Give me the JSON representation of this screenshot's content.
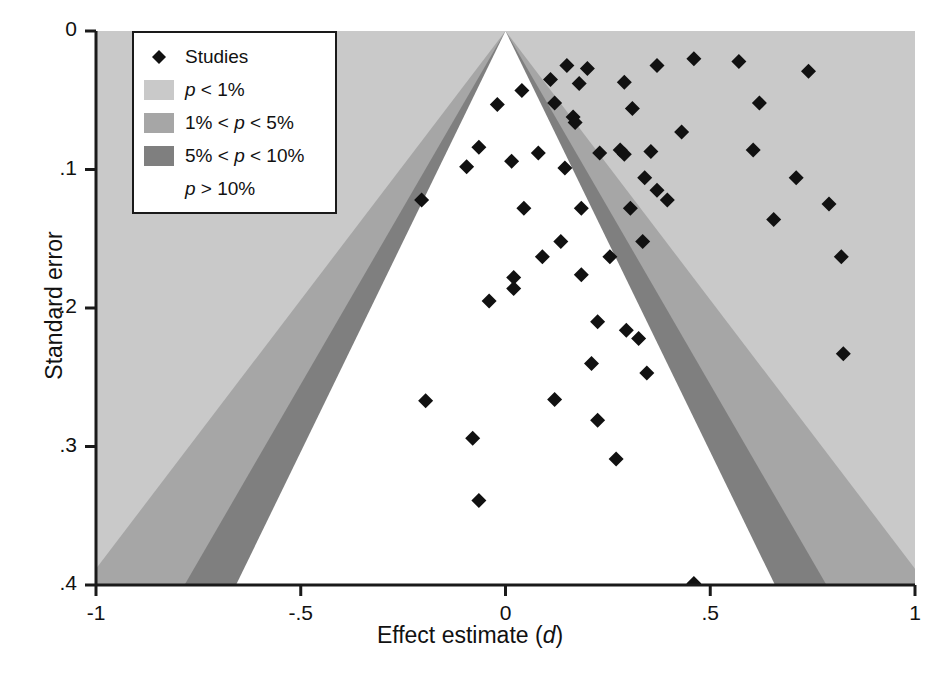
{
  "chart_data": {
    "type": "scatter",
    "subtype": "contour-enhanced funnel plot",
    "title": "",
    "xlabel": "Effect estimate (d)",
    "ylabel": "Standard error",
    "xlim": [
      -1,
      1
    ],
    "ylim": [
      0,
      0.4
    ],
    "y_inverted": true,
    "grid": false,
    "xticks": [
      -1,
      -0.5,
      0,
      0.5,
      1
    ],
    "xticklabels": [
      "-1",
      "-.5",
      "0",
      ".5",
      "1"
    ],
    "yticks": [
      0,
      0.1,
      0.2,
      0.3,
      0.4
    ],
    "yticklabels": [
      "0",
      ".1",
      ".2",
      ".3",
      ".4"
    ],
    "funnel": {
      "apex_x": 0,
      "contours": [
        {
          "name": "p > 10%",
          "z": 1.645,
          "color": "#ffffff"
        },
        {
          "name": "5% < p < 10%",
          "z_from": 1.645,
          "z_to": 1.96,
          "color": "#7f7f7f"
        },
        {
          "name": "1% < p < 5%",
          "z_from": 1.96,
          "z_to": 2.576,
          "color": "#a6a6a6"
        },
        {
          "name": "p < 1%",
          "z_from": 2.576,
          "color": "#c9c9c9"
        }
      ]
    },
    "series": [
      {
        "name": "Studies",
        "marker": "diamond",
        "color": "#111111",
        "points": [
          {
            "d": 0.46,
            "se": 0.02
          },
          {
            "d": 0.15,
            "se": 0.025
          },
          {
            "d": 0.2,
            "se": 0.027
          },
          {
            "d": 0.37,
            "se": 0.025
          },
          {
            "d": 0.57,
            "se": 0.022
          },
          {
            "d": 0.11,
            "se": 0.035
          },
          {
            "d": 0.18,
            "se": 0.038
          },
          {
            "d": 0.29,
            "se": 0.037
          },
          {
            "d": 0.74,
            "se": 0.029
          },
          {
            "d": 0.04,
            "se": 0.043
          },
          {
            "d": -0.02,
            "se": 0.053
          },
          {
            "d": 0.12,
            "se": 0.052
          },
          {
            "d": 0.62,
            "se": 0.052
          },
          {
            "d": 0.31,
            "se": 0.056
          },
          {
            "d": 0.165,
            "se": 0.062
          },
          {
            "d": 0.17,
            "se": 0.066
          },
          {
            "d": 0.43,
            "se": 0.073
          },
          {
            "d": -0.065,
            "se": 0.084
          },
          {
            "d": 0.08,
            "se": 0.088
          },
          {
            "d": 0.23,
            "se": 0.088
          },
          {
            "d": 0.28,
            "se": 0.086
          },
          {
            "d": 0.29,
            "se": 0.089
          },
          {
            "d": 0.355,
            "se": 0.087
          },
          {
            "d": 0.605,
            "se": 0.086
          },
          {
            "d": -0.095,
            "se": 0.098
          },
          {
            "d": 0.015,
            "se": 0.094
          },
          {
            "d": 0.145,
            "se": 0.099
          },
          {
            "d": 0.34,
            "se": 0.106
          },
          {
            "d": 0.71,
            "se": 0.106
          },
          {
            "d": 0.37,
            "se": 0.115
          },
          {
            "d": -0.205,
            "se": 0.122
          },
          {
            "d": 0.395,
            "se": 0.122
          },
          {
            "d": 0.045,
            "se": 0.128
          },
          {
            "d": 0.185,
            "se": 0.128
          },
          {
            "d": 0.305,
            "se": 0.128
          },
          {
            "d": 0.79,
            "se": 0.125
          },
          {
            "d": 0.655,
            "se": 0.136
          },
          {
            "d": 0.135,
            "se": 0.152
          },
          {
            "d": 0.335,
            "se": 0.152
          },
          {
            "d": 0.09,
            "se": 0.163
          },
          {
            "d": 0.255,
            "se": 0.163
          },
          {
            "d": 0.82,
            "se": 0.163
          },
          {
            "d": 0.02,
            "se": 0.178
          },
          {
            "d": 0.02,
            "se": 0.186
          },
          {
            "d": 0.185,
            "se": 0.176
          },
          {
            "d": -0.04,
            "se": 0.195
          },
          {
            "d": 0.225,
            "se": 0.21
          },
          {
            "d": 0.295,
            "se": 0.216
          },
          {
            "d": 0.325,
            "se": 0.222
          },
          {
            "d": 0.825,
            "se": 0.233
          },
          {
            "d": -0.195,
            "se": 0.267
          },
          {
            "d": 0.21,
            "se": 0.24
          },
          {
            "d": 0.345,
            "se": 0.247
          },
          {
            "d": 0.12,
            "se": 0.266
          },
          {
            "d": 0.225,
            "se": 0.281
          },
          {
            "d": -0.08,
            "se": 0.294
          },
          {
            "d": 0.27,
            "se": 0.309
          },
          {
            "d": -0.065,
            "se": 0.339
          },
          {
            "d": 0.46,
            "se": 0.399
          }
        ]
      }
    ]
  },
  "axes": {
    "x_title_pre": "Effect estimate (",
    "x_title_italic": "d",
    "x_title_post": ")",
    "y_title": "Standard error"
  },
  "legend": {
    "items": [
      {
        "label": "Studies",
        "swatch": "marker",
        "color": "#111111"
      },
      {
        "label_pre": "p",
        "label_post": " < 1%",
        "swatch": "fill",
        "color": "#c9c9c9"
      },
      {
        "label_pre": "1% < p",
        "label_post": " < 5%",
        "swatch": "fill",
        "color": "#a6a6a6"
      },
      {
        "label_pre": "5% < p",
        "label_post": " < 10%",
        "swatch": "fill",
        "color": "#7f7f7f"
      },
      {
        "label_pre": "p",
        "label_post": " > 10%",
        "swatch": "none",
        "color": "#ffffff"
      }
    ]
  }
}
